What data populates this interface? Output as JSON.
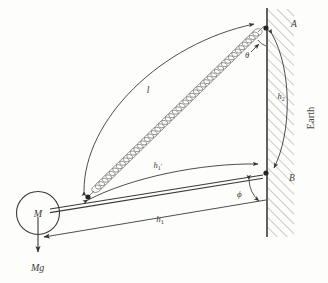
{
  "figure": {
    "background_color": "#fdfdfb",
    "ink_color": "#3a3a3a",
    "labels": {
      "point_a": "A",
      "point_b": "B",
      "earth": "Earth",
      "mass": "M",
      "weight": "Mg",
      "spring_length": "l",
      "theta": "θ",
      "phi": "ϕ",
      "h2": "h",
      "h2_sub": "2",
      "h1_prime": "h",
      "h1_prime_sub": "1",
      "h1_prime_mark": "′",
      "h1": "h",
      "h1_sub": "1"
    }
  }
}
